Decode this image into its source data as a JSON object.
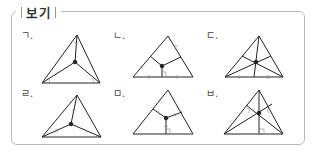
{
  "box": {
    "title": "보기"
  },
  "items": [
    {
      "label": "ㄱ.",
      "figure": "triangle-angle-bisectors-meeting-point"
    },
    {
      "label": "ㄴ.",
      "figure": "triangle-perpendicular-bisectors-circumcenter"
    },
    {
      "label": "ㄷ.",
      "figure": "triangle-medians-centroid"
    },
    {
      "label": "ㄹ.",
      "figure": "triangle-equal-segments-to-vertices"
    },
    {
      "label": "ㅁ.",
      "figure": "triangle-equal-perpendiculars-to-sides"
    },
    {
      "label": "ㅂ.",
      "figure": "triangle-altitudes-orthocenter"
    }
  ],
  "colors": {
    "line": "#222222",
    "frame": "#b8b8b8",
    "mark": "#888888"
  }
}
